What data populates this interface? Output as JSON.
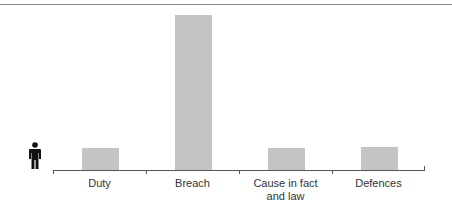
{
  "chart_data": {
    "type": "bar",
    "title": "",
    "xlabel": "",
    "ylabel": "",
    "categories": [
      "Duty",
      "Breach",
      "Cause in fact and law",
      "Defences"
    ],
    "category_lines": [
      [
        "Duty"
      ],
      [
        "Breach"
      ],
      [
        "Cause in fact",
        "and law"
      ],
      [
        "Defences"
      ]
    ],
    "values": [
      1,
      7,
      1,
      1.05
    ],
    "ylim": [
      0,
      7.2
    ],
    "grid": false,
    "legend": null,
    "bar_color": "#c4c4c4",
    "y_axis_icon": "person-icon"
  }
}
